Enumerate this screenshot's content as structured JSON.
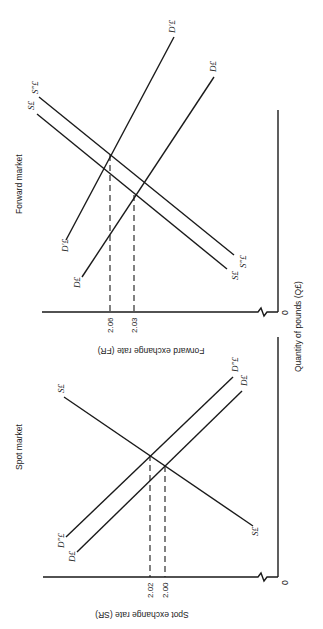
{
  "orientation": "rotated 90deg clockwise",
  "forward_market": {
    "title": "Forward market",
    "y_axis_label": "Forward exchange rate (FR)",
    "x_axis_label": "Quantity of pounds (Q£)",
    "origin": "0",
    "ticks": [
      "2.06",
      "2.03"
    ],
    "curves": {
      "demand": "D£",
      "demand_shifted": "D′£",
      "supply": "S£",
      "supply_shifted": "S″£"
    }
  },
  "spot_market": {
    "title": "Spot market",
    "y_axis_label": "Spot exchange rate (SR)",
    "origin": "0",
    "ticks": [
      "2.02",
      "2.00"
    ],
    "curves": {
      "demand": "D£",
      "demand_shifted": "D″£",
      "supply": "S£"
    }
  }
}
